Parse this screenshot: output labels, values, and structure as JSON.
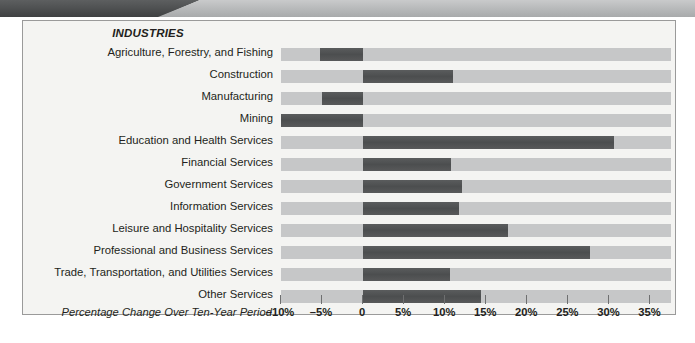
{
  "banner": {
    "dark_color": "#4b4d4e",
    "light_color": "#b6b8b9"
  },
  "chart_data": {
    "type": "bar",
    "orientation": "horizontal",
    "title": "INDUSTRIES",
    "xlabel": "Percentage Change Over Ten-Year Period",
    "ylabel": "INDUSTRIES",
    "xlim": [
      -10,
      37.5
    ],
    "grid": false,
    "legend": null,
    "baseline": 0,
    "tick_labels": [
      "–10%",
      "–5%",
      "0",
      "5%",
      "10%",
      "15%",
      "20%",
      "25%",
      "30%",
      "35%"
    ],
    "tick_values": [
      -10,
      -5,
      0,
      5,
      10,
      15,
      20,
      25,
      30,
      35
    ],
    "categories": [
      "Agriculture, Forestry, and Fishing",
      "Construction",
      "Manufacturing",
      "Mining",
      "Education and Health Services",
      "Financial Services",
      "Government Services",
      "Information Services",
      "Leisure and Hospitality Services",
      "Professional and Business Services",
      "Trade, Transportation, and Utilities Services",
      "Other Services"
    ],
    "values": [
      -5.3,
      11.0,
      -5.0,
      -10.0,
      30.5,
      10.7,
      12.0,
      11.7,
      17.6,
      27.6,
      10.6,
      14.4
    ],
    "bar_color": "#4f5152",
    "track_color": "#c6c7c8",
    "panel_color": "#f4f4f2"
  }
}
